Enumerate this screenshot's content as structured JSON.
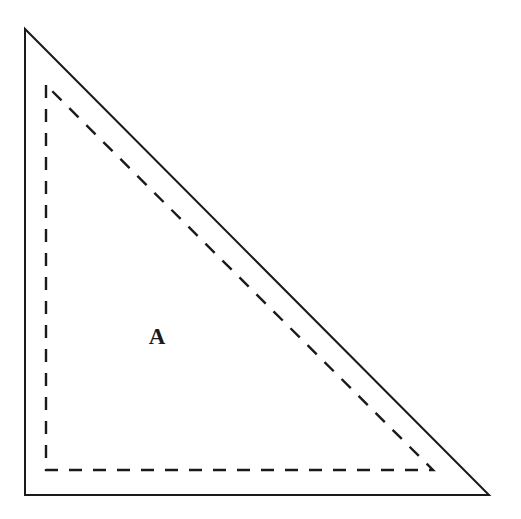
{
  "figure": {
    "background_color": "#ffffff",
    "stroke_color": "#1a1a1a",
    "width": 521,
    "height": 519
  },
  "labels": {
    "region_a": "A"
  },
  "chart_data": {
    "type": "diagram",
    "shapes": [
      {
        "name": "outer-triangle",
        "style": "solid",
        "stroke_width": 2,
        "stroke_color": "#1a1a1a",
        "fill": "none",
        "points": [
          [
            25,
            29
          ],
          [
            25,
            495
          ],
          [
            489,
            495
          ]
        ],
        "description": "Solid right triangle, right angle at bottom-left, vertical leg on left, horizontal leg on bottom, hypotenuse from top-left apex to bottom-right corner"
      },
      {
        "name": "inner-triangle",
        "style": "dashed",
        "stroke_width": 2,
        "stroke_color": "#1a1a1a",
        "fill": "none",
        "dash_pattern": "13 11",
        "points": [
          [
            46,
            85
          ],
          [
            46,
            470
          ],
          [
            433,
            470
          ]
        ],
        "description": "Dashed right triangle inscribed inside the solid triangle, similar in shape, hypotenuse parallel to the solid hypotenuse"
      }
    ],
    "annotations": [
      {
        "name": "region-a-label",
        "text": "A",
        "x": 157,
        "y": 344,
        "font_weight": "bold",
        "font_size": 23,
        "description": "Label A marking the region inside the dashed triangle"
      }
    ],
    "axis": {
      "shown": false
    },
    "grid": false,
    "legend": {
      "shown": false
    }
  }
}
